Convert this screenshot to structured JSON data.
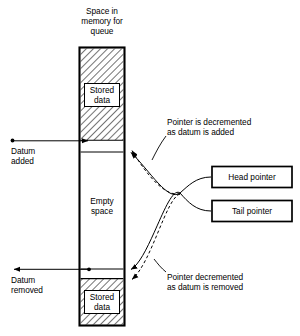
{
  "diagram": {
    "title": "Space in\nmemory for\nqueue",
    "memory_column": {
      "top_block_label": "Stored\ndata",
      "middle_block_label": "Empty\nspace",
      "bottom_block_label": "Stored\ndata"
    },
    "left_annotations": [
      {
        "id": "datum-added",
        "text": "Datum\nadded"
      },
      {
        "id": "datum-removed",
        "text": "Datum\nremoved"
      }
    ],
    "right_annotations": [
      {
        "id": "pointer-decremented-added",
        "text": "Pointer is decremented\nas datum is added"
      },
      {
        "id": "pointer-decremented-removed",
        "text": "Pointer decremented\nas datum is removed"
      }
    ],
    "pointer_boxes": [
      {
        "id": "head-pointer",
        "label": "Head pointer"
      },
      {
        "id": "tail-pointer",
        "label": "Tail pointer"
      }
    ],
    "colors": {
      "stroke": "#000000",
      "background": "#ffffff",
      "hatch": "#000000"
    }
  }
}
